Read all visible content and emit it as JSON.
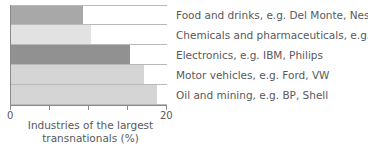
{
  "chart_data": {
    "type": "bar",
    "orientation": "horizontal",
    "title": "",
    "xlabel": "Industries of the largest transnationals (%)",
    "ylabel": "",
    "xlim": [
      0,
      20
    ],
    "xticks": [
      0,
      5,
      10,
      15,
      20
    ],
    "xtick_labels_shown": [
      "0",
      "20"
    ],
    "grid": false,
    "legend_position": "right-inline",
    "categories": [
      "Food and drinks, e.g. Del Monte, Nestlé",
      "Chemicals and pharmaceuticals, e.g. ICI",
      "Electronics, e.g. IBM, Philips",
      "Motor vehicles, e.g. Ford, VW",
      "Oil and mining, e.g. BP, Shell"
    ],
    "values": [
      9.2,
      10.2,
      15.3,
      17.0,
      18.7
    ],
    "bar_colors": [
      "#a8a8a8",
      "#e2e2e2",
      "#919191",
      "#d5d5d5",
      "#d5d5d5"
    ]
  },
  "axis": {
    "tick_start_label": "0",
    "tick_end_label": "20"
  },
  "caption": {
    "line1": "Industries of the largest",
    "line2": "transnationals (%)"
  },
  "colors": {
    "axis": "#8a8a8a",
    "row_rule": "#b9b9b9",
    "text": "#58595b",
    "background": "#ffffff"
  }
}
